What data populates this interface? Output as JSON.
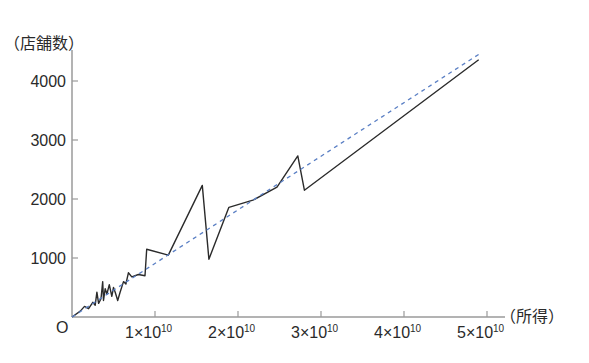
{
  "chart_data": {
    "type": "line",
    "title": "",
    "xlabel": "（所得）",
    "ylabel": "（店舗数）",
    "origin_label": "O",
    "xlim": [
      0,
      52000000000.0
    ],
    "ylim": [
      0,
      4600
    ],
    "x_ticks": [
      {
        "value": 10000000000.0,
        "mantissa": "1",
        "base": "×10",
        "exp": "10"
      },
      {
        "value": 20000000000.0,
        "mantissa": "2",
        "base": "×10",
        "exp": "10"
      },
      {
        "value": 30000000000.0,
        "mantissa": "3",
        "base": "×10",
        "exp": "10"
      },
      {
        "value": 40000000000.0,
        "mantissa": "4",
        "base": "×10",
        "exp": "10"
      },
      {
        "value": 50000000000.0,
        "mantissa": "5",
        "base": "×10",
        "exp": "10"
      }
    ],
    "y_ticks": [
      {
        "value": 1000,
        "label": "1000"
      },
      {
        "value": 2000,
        "label": "2000"
      },
      {
        "value": 3000,
        "label": "3000"
      },
      {
        "value": 4000,
        "label": "4000"
      }
    ],
    "grid": false,
    "series": [
      {
        "name": "店舗数",
        "style": "solid",
        "color": "#2b2b2b",
        "x": [
          0,
          1000000000.0,
          1500000000.0,
          2000000000.0,
          2500000000.0,
          2800000000.0,
          3000000000.0,
          3200000000.0,
          3500000000.0,
          3700000000.0,
          3800000000.0,
          4000000000.0,
          4200000000.0,
          4500000000.0,
          4800000000.0,
          5000000000.0,
          5200000000.0,
          5500000000.0,
          5800000000.0,
          6200000000.0,
          6500000000.0,
          6800000000.0,
          7200000000.0,
          8000000000.0,
          8800000000.0,
          9000000000.0,
          11600000000.0,
          15700000000.0,
          16500000000.0,
          18900000000.0,
          21800000000.0,
          24700000000.0,
          27200000000.0,
          28000000000.0,
          49000000000.0
        ],
        "values": [
          0,
          100,
          180,
          140,
          250,
          200,
          420,
          230,
          310,
          600,
          280,
          480,
          390,
          550,
          350,
          500,
          420,
          280,
          420,
          600,
          560,
          750,
          680,
          720,
          700,
          1150,
          1050,
          2230,
          980,
          1860,
          1980,
          2200,
          2730,
          2150,
          4360
        ]
      },
      {
        "name": "trend",
        "style": "dashed",
        "color": "#5a7fc4",
        "x": [
          0,
          49000000000.0
        ],
        "values": [
          0,
          4450
        ]
      }
    ]
  }
}
